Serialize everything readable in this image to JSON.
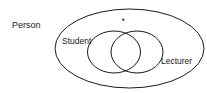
{
  "diagram": {
    "type": "venn",
    "universe_label": "Person",
    "sets": [
      {
        "label": "Student"
      },
      {
        "label": "Lecturer"
      }
    ],
    "marker": "*",
    "colors": {
      "stroke": "#1a1a1a",
      "background": "#ffffff"
    }
  }
}
